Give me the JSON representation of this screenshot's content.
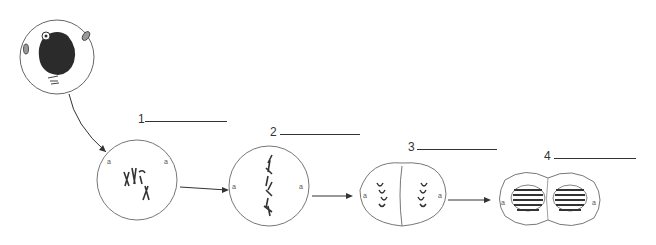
{
  "diagram": {
    "cells": [
      {
        "id": "interphase",
        "number": ""
      },
      {
        "id": "stage-1",
        "number": "1",
        "answer": ""
      },
      {
        "id": "stage-2",
        "number": "2",
        "answer": ""
      },
      {
        "id": "stage-3",
        "number": "3",
        "answer": ""
      },
      {
        "id": "stage-4",
        "number": "4",
        "answer": ""
      }
    ],
    "colors": {
      "line": "#555555",
      "nucleus": "#2a2a2a",
      "chromosome": "#333333"
    }
  }
}
